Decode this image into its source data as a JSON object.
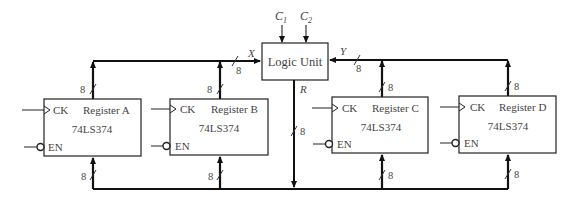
{
  "diagram": {
    "logic_unit": {
      "label": "Logic Unit",
      "control_inputs": [
        "C1",
        "C2"
      ],
      "input_x_label": "X",
      "input_y_label": "Y",
      "output_label": "R"
    },
    "registers": [
      {
        "name": "Register A",
        "part": "74LS374",
        "clock": "CK",
        "enable": "EN"
      },
      {
        "name": "Register B",
        "part": "74LS374",
        "clock": "CK",
        "enable": "EN"
      },
      {
        "name": "Register C",
        "part": "74LS374",
        "clock": "CK",
        "enable": "EN"
      },
      {
        "name": "Register D",
        "part": "74LS374",
        "clock": "CK",
        "enable": "EN"
      }
    ],
    "bus_width": "8"
  }
}
